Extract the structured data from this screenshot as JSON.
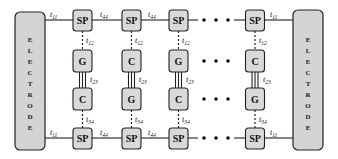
{
  "electrodes": {
    "left": {
      "label": "ELECTRODE",
      "letters": [
        "E",
        "L",
        "E",
        "C",
        "T",
        "R",
        "O",
        "D",
        "E"
      ]
    },
    "right": {
      "label": "ELECTRODE",
      "letters": [
        "E",
        "L",
        "E",
        "C",
        "T",
        "R",
        "O",
        "D",
        "E"
      ]
    }
  },
  "columns": [
    {
      "top": "SP",
      "upper": "G",
      "lower": "C",
      "bottom": "SP"
    },
    {
      "top": "SP",
      "upper": "C",
      "lower": "G",
      "bottom": "SP"
    },
    {
      "top": "SP",
      "upper": "G",
      "lower": "C",
      "bottom": "SP"
    },
    {
      "top": "SP",
      "upper": "C",
      "lower": "G",
      "bottom": "SP"
    }
  ],
  "couplings": {
    "electrode_sp": {
      "base": "t",
      "sub": "11"
    },
    "sp_sp": {
      "base": "t",
      "sub": "44"
    },
    "sp_upper": {
      "base": "t",
      "sub": "12"
    },
    "upper_lower": {
      "base": "t",
      "sub": "23"
    },
    "lower_sp": {
      "base": "t",
      "sub": "34"
    }
  },
  "ellipsis": "• • •",
  "colors": {
    "box_fill": "#d9d9d9",
    "electrode_fill": "#d4d4d4",
    "stroke": "#222222"
  }
}
